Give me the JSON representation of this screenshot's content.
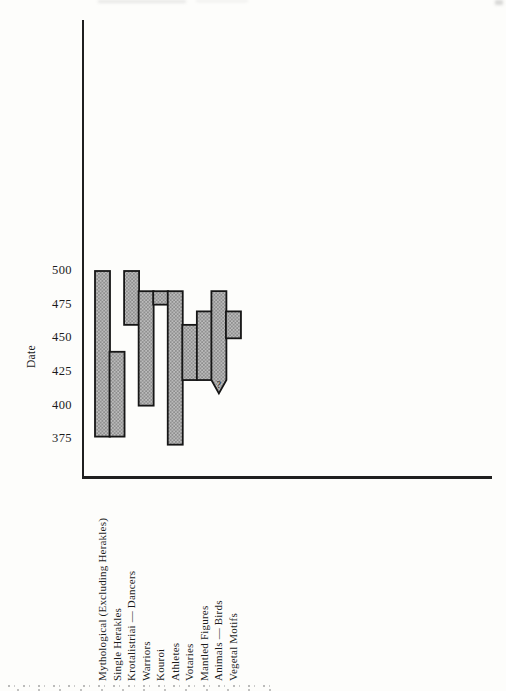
{
  "chart_data": {
    "type": "bar",
    "subtype": "floating-date-range-bars",
    "title": "",
    "ylabel": "Date",
    "yticks": [
      "500",
      "475",
      "450",
      "425",
      "400",
      "375"
    ],
    "axis": {
      "y_top_value": 500,
      "y_bottom_value": 375,
      "grid": false,
      "legend": "none"
    },
    "categories": [
      "Mythological (Excluding Herakles)",
      "Single Herakles",
      "Krotalistriai — Dancers",
      "Warriors",
      "Kouroi",
      "Athletes",
      "Votaries",
      "Mantled Figures",
      "Animals — Birds",
      "Vegetal Motifs"
    ],
    "series": [
      {
        "name": "Mythological (Excluding Herakles)",
        "start": 500,
        "end": 377
      },
      {
        "name": "Single Herakles",
        "start": 440,
        "end": 377
      },
      {
        "name": "Krotalistriai — Dancers",
        "start": 500,
        "end": 460
      },
      {
        "name": "Warriors",
        "start": 485,
        "end": 400
      },
      {
        "name": "Kouroi",
        "start": 485,
        "end": 475
      },
      {
        "name": "Athletes",
        "start": 485,
        "end": 371
      },
      {
        "name": "Votaries",
        "start": 460,
        "end": 419
      },
      {
        "name": "Mantled Figures",
        "start": 470,
        "end": 419
      },
      {
        "name": "Animals — Birds",
        "start": 485,
        "end": 419,
        "arrow_end": 409,
        "uncertain": true,
        "marker": "?"
      },
      {
        "name": "Vegetal Motifs",
        "start": 470,
        "end": 450
      }
    ],
    "colors": {
      "bar_fill_base": "#bdbdbd",
      "bar_fill_dots": "#8b8b8b",
      "bar_border": "#161616",
      "axis_line": "#1f1f1f",
      "text": "#1b1b1b"
    }
  }
}
